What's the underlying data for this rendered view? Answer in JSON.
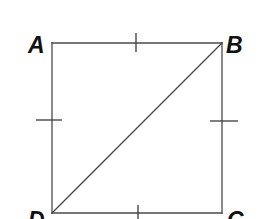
{
  "diagram": {
    "type": "geometry-figure",
    "shape": "square",
    "vertices": {
      "A": {
        "label": "A",
        "x": 52,
        "y": 43
      },
      "B": {
        "label": "B",
        "x": 222,
        "y": 43
      },
      "C": {
        "label": "C",
        "x": 222,
        "y": 213
      },
      "D": {
        "label": "D",
        "x": 52,
        "y": 213
      }
    },
    "sides": [
      {
        "name": "AB",
        "from": "A",
        "to": "B",
        "tick_marks": 1
      },
      {
        "name": "BC",
        "from": "B",
        "to": "C",
        "tick_marks": 1
      },
      {
        "name": "CD",
        "from": "C",
        "to": "D",
        "tick_marks": 1
      },
      {
        "name": "DA",
        "from": "D",
        "to": "A",
        "tick_marks": 1
      }
    ],
    "diagonals": [
      {
        "name": "DB",
        "from": "D",
        "to": "B"
      }
    ],
    "colors": {
      "line": "#4a4a4a",
      "label": "#111111",
      "background": "#ffffff"
    }
  }
}
